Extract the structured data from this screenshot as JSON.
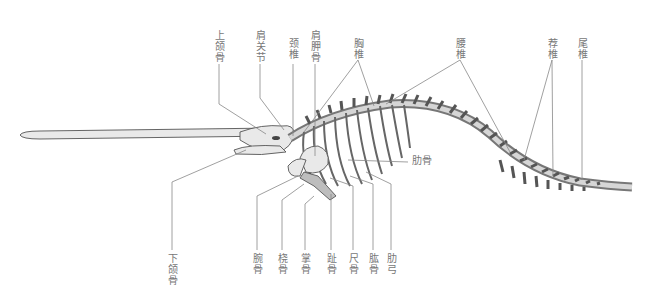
{
  "figure": {
    "labels_top": [
      {
        "id": "maxilla",
        "text": "上颌骨",
        "x": 214,
        "y": 30
      },
      {
        "id": "shoulder-joint",
        "text": "肩关节",
        "x": 256,
        "y": 30
      },
      {
        "id": "cervical-vertebrae",
        "text": "颈椎",
        "x": 288,
        "y": 38
      },
      {
        "id": "scapula",
        "text": "肩胛骨",
        "x": 310,
        "y": 30
      },
      {
        "id": "thoracic-vertebrae",
        "text": "胸椎",
        "x": 354,
        "y": 38
      },
      {
        "id": "lumbar-vertebrae",
        "text": "腰椎",
        "x": 456,
        "y": 38
      },
      {
        "id": "sacral-vertebrae",
        "text": "荐椎",
        "x": 548,
        "y": 38
      },
      {
        "id": "caudal-vertebrae",
        "text": "尾椎",
        "x": 578,
        "y": 38
      }
    ],
    "labels_side": [
      {
        "id": "ribs",
        "text": "肋骨",
        "x": 412,
        "y": 160
      }
    ],
    "labels_bottom": [
      {
        "id": "mandible",
        "text": "下颌骨",
        "x": 166,
        "y": 253
      },
      {
        "id": "carpals",
        "text": "腕骨",
        "x": 252,
        "y": 253
      },
      {
        "id": "radius",
        "text": "桡骨",
        "x": 277,
        "y": 253
      },
      {
        "id": "metacarpals",
        "text": "掌骨",
        "x": 299,
        "y": 253
      },
      {
        "id": "phalanges",
        "text": "趾骨",
        "x": 326,
        "y": 253
      },
      {
        "id": "ulna",
        "text": "尺骨",
        "x": 348,
        "y": 253
      },
      {
        "id": "humerus",
        "text": "肱骨",
        "x": 368,
        "y": 253
      },
      {
        "id": "costal-arch",
        "text": "肋弓",
        "x": 386,
        "y": 253
      }
    ]
  }
}
